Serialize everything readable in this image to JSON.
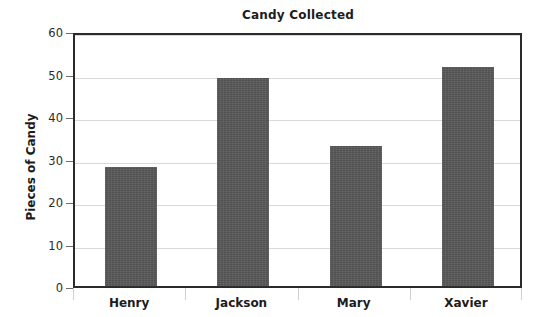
{
  "chart_data": {
    "type": "bar",
    "title": "Candy Collected",
    "xlabel": "",
    "ylabel": "Pieces of Candy",
    "categories": [
      "Henry",
      "Jackson",
      "Mary",
      "Xavier"
    ],
    "values": [
      28,
      49,
      33,
      51.5
    ],
    "ylim": [
      0,
      60
    ],
    "yticks": [
      0,
      10,
      20,
      30,
      40,
      50,
      60
    ],
    "ytick_labels": [
      "0",
      "10",
      "20",
      "30",
      "40",
      "50",
      "60"
    ],
    "grid": true,
    "legend": false,
    "bar_color": "#595959",
    "grid_color": "#d9d9d9",
    "axis_color": "#2b2b2b",
    "background": "#ffffff"
  }
}
